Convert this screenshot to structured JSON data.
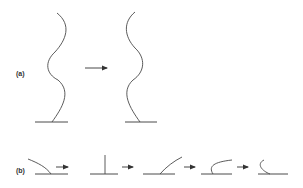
{
  "panels": {
    "a": {
      "label": "(a)"
    },
    "b": {
      "label": "(b)"
    }
  },
  "colors": {
    "stroke": "#4a4a4a",
    "label": "#333333",
    "background": "#ffffff"
  }
}
